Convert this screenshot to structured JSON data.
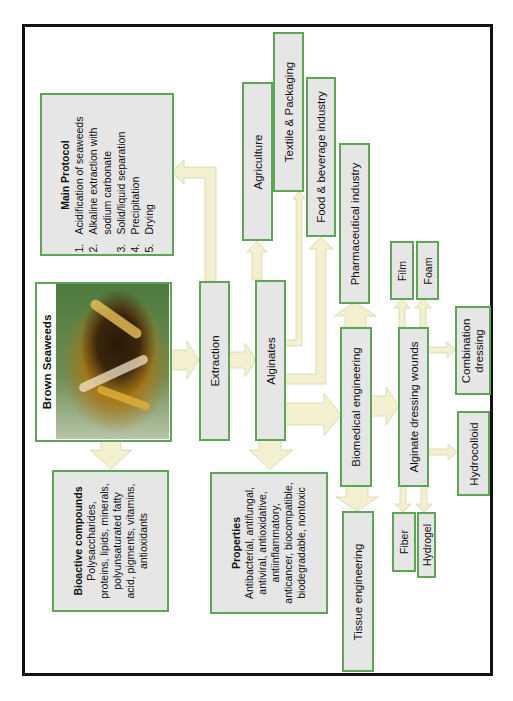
{
  "diagram": {
    "orientation": "rotated-90-ccw",
    "colors": {
      "box_fill": "#e6e6e6",
      "box_border": "#5fa557",
      "arrow_fill": "#f3f0d2",
      "arrow_stroke": "#dcdcb4",
      "frame": "#111111"
    },
    "nodes": {
      "brown_seaweeds": {
        "label": "Brown Seaweeds"
      },
      "extraction": {
        "label": "Extraction"
      },
      "alginates": {
        "label": "Alginates"
      },
      "main_protocol": {
        "title": "Main Protocol",
        "steps": [
          {
            "num": "1.",
            "text": "Acidification of seaweeds"
          },
          {
            "num": "2.",
            "text": "Alkaline extraction with"
          },
          {
            "num": "",
            "text": "sodium carbonate"
          },
          {
            "num": "3.",
            "text": "Solid/liquid separation"
          },
          {
            "num": "4.",
            "text": "Precipitation"
          },
          {
            "num": "5.",
            "text": "Drying"
          }
        ]
      },
      "bioactive": {
        "title": "Bioactive compounds",
        "lines": [
          "Polysaccharides,",
          "proteins, lipids, minerals,",
          "polyunsaturated fatty",
          "acid, pigments, vitamins,",
          "antioxidants"
        ]
      },
      "properties": {
        "title": "Properties",
        "lines": [
          "Antibacterial, antifungal,",
          "antiviral, antioxidative,",
          "antiinflammatory,",
          "anticancer, biocompatible,",
          "biodegradable, nontoxic"
        ]
      },
      "agriculture": {
        "label": "Agriculture"
      },
      "textile": {
        "label": "Textile & Packaging"
      },
      "food": {
        "label": "Food & beverage industry"
      },
      "pharma": {
        "label": "Pharmaceutical industry"
      },
      "biomedical": {
        "label": "Biomedical engineering"
      },
      "tissue": {
        "label": "Tissue engineering"
      },
      "dressing": {
        "label": "Alginate dressing wounds"
      },
      "film": {
        "label": "Film"
      },
      "foam": {
        "label": "Foam"
      },
      "fiber": {
        "label": "Fiber"
      },
      "hydrogel": {
        "label": "Hydrogel"
      },
      "combination": {
        "line1": "Combination",
        "line2": "dressing"
      },
      "hydrocolloid": {
        "label": "Hydrocolloid"
      }
    },
    "edges": [
      [
        "brown_seaweeds",
        "extraction"
      ],
      [
        "brown_seaweeds",
        "bioactive"
      ],
      [
        "extraction",
        "alginates"
      ],
      [
        "extraction",
        "main_protocol"
      ],
      [
        "alginates",
        "properties"
      ],
      [
        "alginates",
        "agriculture"
      ],
      [
        "alginates",
        "textile"
      ],
      [
        "alginates",
        "food"
      ],
      [
        "alginates",
        "biomedical"
      ],
      [
        "biomedical",
        "pharma"
      ],
      [
        "biomedical",
        "tissue"
      ],
      [
        "biomedical",
        "dressing"
      ],
      [
        "dressing",
        "film"
      ],
      [
        "dressing",
        "foam"
      ],
      [
        "dressing",
        "fiber"
      ],
      [
        "dressing",
        "hydrogel"
      ],
      [
        "dressing",
        "combination"
      ],
      [
        "dressing",
        "hydrocolloid"
      ]
    ]
  }
}
